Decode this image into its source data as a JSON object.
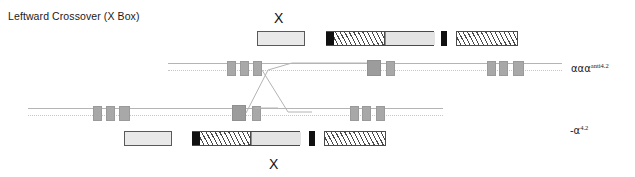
{
  "figure": {
    "title": "Leftward Crossover (X Box)",
    "crossover_marker_top": "X",
    "crossover_marker_bottom": "X",
    "colors": {
      "plain_fill": "#e9e9e9",
      "black_fill": "#101010",
      "hatch_line": "#4a4a4a",
      "grey_fill": "#e4e4e4",
      "gene_block": "#a8a8a8",
      "rail_line": "#b4b4b4",
      "text": "#1a1a1a"
    }
  },
  "top_fragments": [
    {
      "name": "fragment-plain-1",
      "style": "plain",
      "x": 257,
      "y": 31,
      "w": 48,
      "h": 15,
      "segments": [
        {
          "style": "plain",
          "left": 0,
          "width": 48
        }
      ]
    },
    {
      "name": "fragment-composite-1",
      "style": "composite",
      "x": 326,
      "y": 31,
      "w": 108,
      "h": 15,
      "segments": [
        {
          "style": "black",
          "left": 0,
          "width": 7
        },
        {
          "style": "hatch",
          "left": 7,
          "width": 51
        },
        {
          "style": "grey",
          "left": 58,
          "width": 50
        }
      ]
    },
    {
      "name": "fragment-black-tick-1",
      "style": "black",
      "x": 441,
      "y": 31,
      "w": 6,
      "h": 15,
      "segments": [
        {
          "style": "black",
          "left": 0,
          "width": 6
        }
      ]
    },
    {
      "name": "fragment-hatch-1",
      "style": "hatch",
      "x": 456,
      "y": 31,
      "w": 62,
      "h": 15,
      "segments": [
        {
          "style": "hatch",
          "left": 0,
          "width": 62
        }
      ]
    }
  ],
  "bottom_fragments": [
    {
      "name": "fragment-plain-2",
      "style": "plain",
      "x": 124,
      "y": 131,
      "w": 48,
      "h": 15,
      "segments": [
        {
          "style": "plain",
          "left": 0,
          "width": 48
        }
      ]
    },
    {
      "name": "fragment-composite-2",
      "style": "composite",
      "x": 192,
      "y": 131,
      "w": 108,
      "h": 15,
      "segments": [
        {
          "style": "black",
          "left": 0,
          "width": 7
        },
        {
          "style": "hatch",
          "left": 7,
          "width": 51
        },
        {
          "style": "grey",
          "left": 58,
          "width": 50
        }
      ]
    },
    {
      "name": "fragment-black-tick-2",
      "style": "black",
      "x": 309,
      "y": 131,
      "w": 6,
      "h": 15,
      "segments": [
        {
          "style": "black",
          "left": 0,
          "width": 6
        }
      ]
    },
    {
      "name": "fragment-hatch-2",
      "style": "hatch",
      "x": 324,
      "y": 131,
      "w": 62,
      "h": 15,
      "segments": [
        {
          "style": "hatch",
          "left": 0,
          "width": 62
        }
      ]
    }
  ],
  "top_chromosome": {
    "name": "chromosome-aaa-anti42",
    "label_alpha": "ααα",
    "label_sup": "anti4.2",
    "label_x": 571,
    "label_y": 62,
    "rail_y": 68,
    "rail_start": 168,
    "rail_end": 562,
    "genes": [
      {
        "x": 227,
        "w": 9,
        "h": 15
      },
      {
        "x": 240,
        "w": 9,
        "h": 15
      },
      {
        "x": 253,
        "w": 9,
        "h": 15
      },
      {
        "x": 367,
        "w": 14,
        "h": 15
      },
      {
        "x": 386,
        "w": 9,
        "h": 15
      },
      {
        "x": 487,
        "w": 9,
        "h": 15
      },
      {
        "x": 499,
        "w": 9,
        "h": 15
      },
      {
        "x": 513,
        "w": 11,
        "h": 15
      }
    ]
  },
  "bottom_chromosome": {
    "name": "chromosome-alpha-42",
    "label_alpha": "-α",
    "label_sup": "4.2",
    "label_x": 570,
    "label_y": 124,
    "rail_y": 113,
    "rail_start": 28,
    "rail_end": 443,
    "genes": [
      {
        "x": 93,
        "w": 9,
        "h": 15
      },
      {
        "x": 106,
        "w": 9,
        "h": 15
      },
      {
        "x": 119,
        "w": 11,
        "h": 15
      },
      {
        "x": 232,
        "w": 14,
        "h": 15
      },
      {
        "x": 252,
        "w": 9,
        "h": 15
      },
      {
        "x": 350,
        "w": 9,
        "h": 15
      },
      {
        "x": 362,
        "w": 9,
        "h": 15
      },
      {
        "x": 376,
        "w": 9,
        "h": 15
      }
    ]
  },
  "crossover": {
    "name": "crossover-region",
    "description": "X-shaped recombination strands between the two chromosome rails",
    "top_marker": {
      "x": 274,
      "y": 11
    },
    "bottom_marker": {
      "x": 269,
      "y": 157
    }
  }
}
